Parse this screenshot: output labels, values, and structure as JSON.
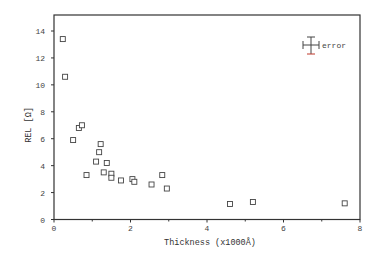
{
  "chart_data": {
    "type": "scatter",
    "title": "",
    "xlabel": "Thickness (x1000Å)",
    "ylabel": "REL [Ω]",
    "xlim": [
      0,
      8
    ],
    "ylim": [
      0,
      15
    ],
    "xticks": [
      0,
      2,
      4,
      6,
      8
    ],
    "xticks_minor": [
      1,
      3,
      5,
      7
    ],
    "yticks": [
      0,
      2,
      4,
      6,
      8,
      10,
      12,
      14
    ],
    "grid": false,
    "marker": "open-square",
    "legend": {
      "label": "error",
      "position": "top-right",
      "symbol": "error-bar-cross"
    },
    "series": [
      {
        "name": "REL",
        "points": [
          {
            "x": 0.23,
            "y": 13.4
          },
          {
            "x": 0.29,
            "y": 10.6
          },
          {
            "x": 0.5,
            "y": 5.9
          },
          {
            "x": 0.65,
            "y": 6.8
          },
          {
            "x": 0.73,
            "y": 7.0
          },
          {
            "x": 0.85,
            "y": 3.3
          },
          {
            "x": 1.1,
            "y": 4.3
          },
          {
            "x": 1.18,
            "y": 5.0
          },
          {
            "x": 1.22,
            "y": 5.6
          },
          {
            "x": 1.3,
            "y": 3.5
          },
          {
            "x": 1.38,
            "y": 4.2
          },
          {
            "x": 1.5,
            "y": 3.4
          },
          {
            "x": 1.5,
            "y": 3.1
          },
          {
            "x": 1.75,
            "y": 2.9
          },
          {
            "x": 2.05,
            "y": 3.0
          },
          {
            "x": 2.1,
            "y": 2.8
          },
          {
            "x": 2.55,
            "y": 2.6
          },
          {
            "x": 2.83,
            "y": 3.3
          },
          {
            "x": 2.95,
            "y": 2.3
          },
          {
            "x": 4.6,
            "y": 1.15
          },
          {
            "x": 5.2,
            "y": 1.3
          },
          {
            "x": 7.6,
            "y": 1.2
          }
        ]
      }
    ]
  },
  "colors": {
    "axis": "#333333",
    "marker": "#444444",
    "error_accent": "#c0392b"
  }
}
